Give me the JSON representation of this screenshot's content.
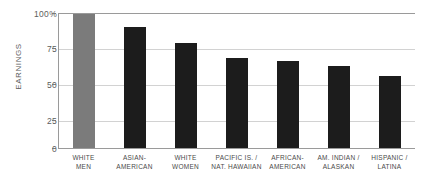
{
  "chart_data": {
    "type": "bar",
    "title": "",
    "xlabel": "",
    "ylabel": "EARNINGS",
    "ylim": [
      0,
      100
    ],
    "grid": true,
    "legend": "none",
    "unit": "percent",
    "categories": [
      "WHITE MEN",
      "ASIAN-AMERICAN",
      "WHITE WOMEN",
      "PACIFIC IS. / NAT. HAWAIIAN",
      "AFRICAN-AMERICAN",
      "AM. INDIAN / ALASKAN",
      "HISPANIC / LATINA"
    ],
    "category_lines": [
      [
        "WHITE",
        "MEN"
      ],
      [
        "ASIAN-",
        "AMERICAN"
      ],
      [
        "WHITE",
        "WOMEN"
      ],
      [
        "PACIFIC IS. /",
        "NAT. HAWAIIAN"
      ],
      [
        "AFRICAN-",
        "AMERICAN"
      ],
      [
        "AM. INDIAN /",
        "ALASKAN"
      ],
      [
        "HISPANIC /",
        "LATINA"
      ]
    ],
    "values": [
      100,
      90,
      78,
      67,
      65,
      61,
      54
    ],
    "bar_colors": [
      "#7b7b7b",
      "#1c1c1c",
      "#1c1c1c",
      "#1c1c1c",
      "#1c1c1c",
      "#1c1c1c",
      "#1c1c1c"
    ],
    "yticks": [
      100,
      75,
      50,
      25,
      0
    ],
    "ytick_labels": [
      "100%",
      "75",
      "50",
      "25",
      "0"
    ]
  },
  "axis": {
    "y_title": "EARNINGS",
    "tick_100": "100%",
    "tick_75": "75",
    "tick_50": "50",
    "tick_25": "25",
    "tick_0": "0"
  },
  "categories": {
    "c0_l1": "WHITE",
    "c0_l2": "MEN",
    "c1_l1": "ASIAN-",
    "c1_l2": "AMERICAN",
    "c2_l1": "WHITE",
    "c2_l2": "WOMEN",
    "c3_l1": "PACIFIC IS. /",
    "c3_l2": "NAT. HAWAIIAN",
    "c4_l1": "AFRICAN-",
    "c4_l2": "AMERICAN",
    "c5_l1": "AM. INDIAN /",
    "c5_l2": "ALASKAN",
    "c6_l1": "HISPANIC /",
    "c6_l2": "LATINA"
  }
}
